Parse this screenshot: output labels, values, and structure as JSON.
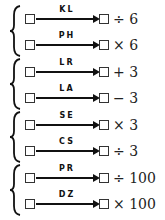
{
  "groups": [
    {
      "rows": [
        {
          "label": "KL",
          "op": "÷ 6"
        },
        {
          "label": "PH",
          "op": "× 6"
        }
      ]
    },
    {
      "rows": [
        {
          "label": "LR",
          "op": "+ 3"
        },
        {
          "label": "LA",
          "op": "− 3"
        }
      ]
    },
    {
      "rows": [
        {
          "label": "SE",
          "op": "× 3"
        },
        {
          "label": "CS",
          "op": "÷ 3"
        }
      ]
    },
    {
      "rows": [
        {
          "label": "PR",
          "op": "÷ 100"
        },
        {
          "label": "DZ",
          "op": "× 100"
        }
      ]
    }
  ]
}
